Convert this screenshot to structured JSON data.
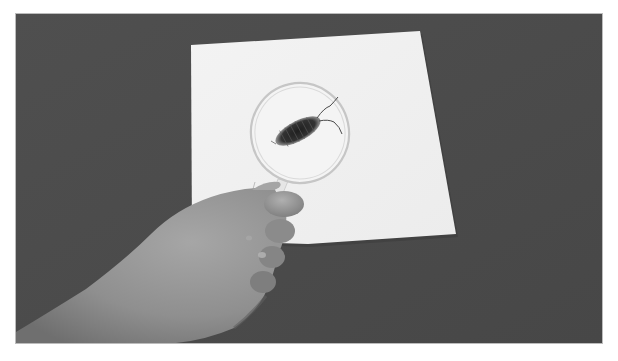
{
  "image": {
    "description": "Grayscale photograph of a child's hand holding a magnifying glass over a woodlouse (pill bug) on a white sheet of paper, on a dark gray surface",
    "subjects": [
      "hand",
      "magnifying-glass",
      "woodlouse",
      "white-paper",
      "dark-surface"
    ],
    "colors": {
      "surface": "#4b4b4b",
      "paper": "#f1f1f1",
      "paper_shadow": "#d9d9d9",
      "lens_rim": "#c4c4c4",
      "bug": "#2b2b2b",
      "skin_light": "#a8a8a8",
      "skin_mid": "#8e8e8e",
      "skin_dark": "#6a6a6a",
      "frame_border": "#bcbcbc",
      "page_background": "#ffffff"
    }
  }
}
